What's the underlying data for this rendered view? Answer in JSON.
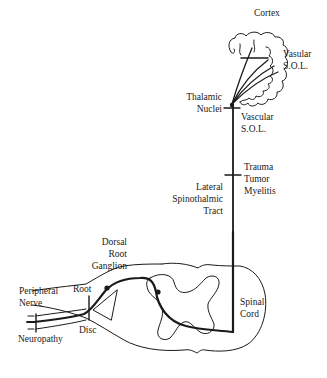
{
  "labels": {
    "cortex": "Cortex",
    "vascular_sol_top_1": "Vasular",
    "vascular_sol_top_2": "S.O.L.",
    "thalamic_1": "Thalamic",
    "thalamic_2": "Nuclei",
    "vascular_sol_mid_1": "Vascular",
    "vascular_sol_mid_2": "S.O.L.",
    "trauma": "Trauma",
    "tumor": "Tumor",
    "myelitis": "Myelitis",
    "lateral_1": "Lateral",
    "lateral_2": "Spinothalmic",
    "lateral_3": "Tract",
    "dorsal_1": "Dorsal",
    "dorsal_2": "Root",
    "dorsal_3": "Ganglion",
    "peripheral_1": "Peripheral",
    "peripheral_2": "Nerve",
    "root": "Root",
    "disc": "Disc",
    "neuropathy": "Neuropathy",
    "spinal_1": "Spinal",
    "spinal_2": "Cord"
  },
  "colors": {
    "stroke": "#1a1a1a",
    "background": "#ffffff"
  }
}
